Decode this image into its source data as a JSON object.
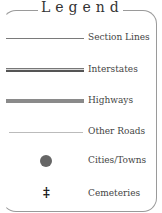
{
  "legend": {
    "title": "Legend",
    "items": [
      {
        "label": "Section Lines",
        "symbol": "thin-line",
        "color": "#7a7a7a"
      },
      {
        "label": "Interstates",
        "symbol": "double-line",
        "color": "#555555"
      },
      {
        "label": "Highways",
        "symbol": "thick-line",
        "color": "#8a8a8a"
      },
      {
        "label": "Other Roads",
        "symbol": "hairline",
        "color": "#bbbbbb"
      },
      {
        "label": "Cities/Towns",
        "symbol": "dot",
        "color": "#666666"
      },
      {
        "label": "Cemeteries",
        "symbol": "cross-icon",
        "glyph": "‡"
      }
    ]
  }
}
